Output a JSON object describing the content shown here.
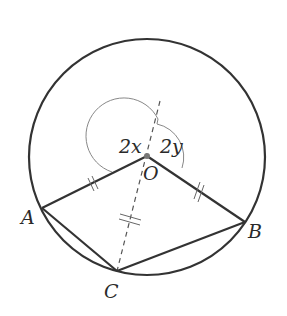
{
  "diagram": {
    "type": "circle-geometry",
    "circle": {
      "cx": 147,
      "cy": 157,
      "r": 118,
      "stroke": "#333333"
    },
    "points": {
      "O": {
        "label": "O",
        "x": 147,
        "y": 156
      },
      "A": {
        "label": "A",
        "x": 42,
        "y": 208
      },
      "B": {
        "label": "B",
        "x": 245,
        "y": 222
      },
      "C": {
        "label": "C",
        "x": 117,
        "y": 271
      }
    },
    "angles": [
      {
        "label": "2x",
        "between": [
          "OA",
          "OC-extended"
        ]
      },
      {
        "label": "2y",
        "between": [
          "OC-extended",
          "OB"
        ]
      }
    ],
    "segments": [
      "OA",
      "OB",
      "AC",
      "BC",
      "OC (dashed, extended)"
    ],
    "equal_marks": "OA = OB = OC (double tick marks)",
    "labels": {
      "O": "O",
      "A": "A",
      "B": "B",
      "C": "C",
      "angle_x": "2x",
      "angle_y": "2y"
    }
  }
}
